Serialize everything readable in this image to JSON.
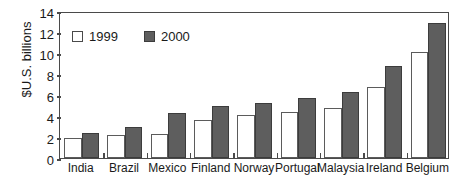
{
  "chart_data": {
    "type": "bar",
    "title": "",
    "subtitle": "",
    "xlabel": "",
    "ylabel": "$U.S. billions",
    "ylim": [
      0,
      14
    ],
    "ytick_interval": 2,
    "yticks": [
      14,
      12,
      10,
      8,
      6,
      4,
      2,
      0
    ],
    "grid": false,
    "legend_position": "top-left",
    "categories": [
      "India",
      "Brazil",
      "Mexico",
      "Finland",
      "Norway",
      "Portugal",
      "Malaysia",
      "Ireland",
      "Belgium"
    ],
    "series": [
      {
        "name": "1999",
        "color": "#ffffff",
        "edge_color": "#5b5b5b",
        "values": [
          1.9,
          2.2,
          2.3,
          3.6,
          4.1,
          4.4,
          4.8,
          6.8,
          10.1
        ]
      },
      {
        "name": "2000",
        "color": "#5e5e5e",
        "edge_color": "#3c3c3c",
        "values": [
          2.4,
          3.0,
          4.3,
          5.0,
          5.2,
          5.7,
          6.3,
          8.8,
          12.9
        ]
      }
    ]
  },
  "legend": {
    "entries": [
      {
        "label": "1999",
        "swatch": "legend-swatch-1999"
      },
      {
        "label": "2000",
        "swatch": "legend-swatch-2000"
      }
    ]
  },
  "axis": {
    "y_title": "$U.S. billions"
  },
  "colors": {
    "axis": "#4a4a4a",
    "text": "#1a1a1a",
    "series_1999_fill": "#ffffff",
    "series_2000_fill": "#5e5e5e",
    "background": "#ffffff"
  }
}
